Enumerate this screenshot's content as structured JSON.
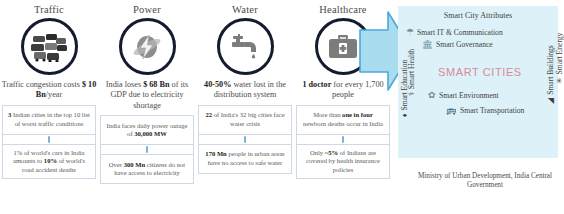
{
  "pillars": [
    {
      "title": "Traffic",
      "icon": "traffic-jam-icon",
      "headline_pre": "Traffic congestion costs ",
      "headline_bold": "$ 10 Bn",
      "headline_post": "/year",
      "stats": [
        {
          "pre": "",
          "bold": "3",
          "post": " Indian cities in the top 10 list of worst traffic conditions"
        },
        {
          "pre": "1% of world's cars in India amounts to ",
          "bold": "10%",
          "post": " of world's road accident deaths"
        }
      ]
    },
    {
      "title": "Power",
      "icon": "power-bolt-icon",
      "headline_pre": "India loses ",
      "headline_bold": "$ 68 Bn",
      "headline_post": " of its GDP due to electricity shortage",
      "stats": [
        {
          "pre": "India faces daily power outage of ",
          "bold": "30,000 MW",
          "post": ""
        },
        {
          "pre": "Over ",
          "bold": "300 Mn",
          "post": " citizens do not have access to electricity"
        }
      ]
    },
    {
      "title": "Water",
      "icon": "water-tap-icon",
      "headline_pre": "",
      "headline_bold": "40-50%",
      "headline_post": " water lost in the distribution system",
      "stats": [
        {
          "pre": "",
          "bold": "22",
          "post": " of India's 32 big cities face water crisis"
        },
        {
          "pre": "",
          "bold": "170 Mn",
          "post": " people in urban areas have no access to safe water"
        }
      ]
    },
    {
      "title": "Healthcare",
      "icon": "medical-kit-icon",
      "headline_pre": "",
      "headline_bold": "1 doctor",
      "headline_post": " for every 1,700 people",
      "stats": [
        {
          "pre": "More than ",
          "bold": "one in four",
          "post": " newborn deaths occur in India"
        },
        {
          "pre": "Only ",
          "bold": "~5%",
          "post": " of Indians are covered by health insurance policies"
        }
      ]
    }
  ],
  "panel": {
    "title": "Smart City Attributes",
    "core_label": "SMART CITIES",
    "attributes": {
      "it": "Smart IT & Communication",
      "governance": "Smart Governance",
      "environment": "Smart Environment",
      "transportation": "Smart Transportation",
      "education": "Smart Education",
      "health": "Smart Health",
      "buildings": "Smart Buildings",
      "energy": "Smart Energy"
    },
    "glyphs": {
      "it": "☂",
      "governance": "ἽB",
      "environment": "✿",
      "transportation": "▭",
      "education": "♠",
      "health": "⚕",
      "buildings": "◢",
      "energy": "✳"
    },
    "background": "#ddf1f8",
    "core_color": "#d98a9a"
  },
  "arrow": {
    "name": "right-block-arrow",
    "fill": "#aadcf0",
    "stroke": "#4aa8d8"
  },
  "caption": "Ministry of Urban Development, India Central Government"
}
